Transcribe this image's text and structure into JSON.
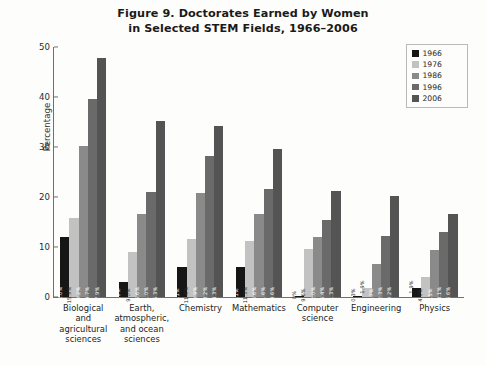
{
  "figure": {
    "title_line1": "Figure 9. Doctorates Earned by Women",
    "title_line2": "in Selected STEM Fields, 1966–2006"
  },
  "legend": {
    "position": "top-right",
    "entries": [
      {
        "label": "1966",
        "color": "#161616"
      },
      {
        "label": "1976",
        "color": "#c2c2c2"
      },
      {
        "label": "1986",
        "color": "#8a8a8a"
      },
      {
        "label": "1996",
        "color": "#6a6a6a"
      },
      {
        "label": "2006",
        "color": "#545454"
      }
    ]
  },
  "chart_data": {
    "type": "bar",
    "title": "Figure 9. Doctorates Earned by Women in Selected STEM Fields, 1966–2006",
    "xlabel": "",
    "ylabel": "Percentage",
    "ylim": [
      0,
      50
    ],
    "yticks": [
      "0",
      "10",
      "20",
      "30",
      "40",
      "50"
    ],
    "grid": false,
    "legend_position": "top-right",
    "categories": [
      "Biological and agricultural sciences",
      "Earth, atmospheric, and ocean sciences",
      "Chemistry",
      "Mathematics",
      "Computer science",
      "Engineering",
      "Physics"
    ],
    "category_lines": [
      [
        "Biological and",
        "agricultural",
        "sciences"
      ],
      [
        "Earth,",
        "atmospheric,",
        "and ocean",
        "sciences"
      ],
      [
        "Chemistry"
      ],
      [
        "Mathematics"
      ],
      [
        "Computer",
        "science"
      ],
      [
        "Engineering"
      ],
      [
        "Physics"
      ]
    ],
    "series": [
      {
        "name": "1966",
        "color": "#161616",
        "values": [
          12.0,
          3.0,
          6.1,
          6.1,
          0.0,
          0.3,
          1.9
        ],
        "labels": [
          "12.0%",
          "3.0%",
          "6.1%",
          "6.1%",
          "0%",
          "0.3%",
          "1.9%"
        ]
      },
      {
        "name": "1976",
        "color": "#c2c2c2",
        "values": [
          15.9,
          9.0,
          11.6,
          11.3,
          9.6,
          1.9,
          4.0
        ],
        "labels": [
          "15.9%",
          "9.0%",
          "11.6%",
          "11.3%",
          "9.6%",
          "1.9%",
          "4.0%"
        ]
      },
      {
        "name": "1986",
        "color": "#8a8a8a",
        "values": [
          30.2,
          16.6,
          20.9,
          16.6,
          12.0,
          6.7,
          9.5
        ],
        "labels": [
          "30.2%",
          "16.6%",
          "20.9%",
          "16.6%",
          "12.0%",
          "6.7%",
          "9.5%"
        ]
      },
      {
        "name": "1996",
        "color": "#6a6a6a",
        "values": [
          39.7,
          21.0,
          28.2,
          21.6,
          15.4,
          12.3,
          13.1
        ],
        "labels": [
          "39.7%",
          "21.0%",
          "28.2%",
          "21.6%",
          "15.4%",
          "12.3%",
          "13.1%"
        ]
      },
      {
        "name": "2006",
        "color": "#545454",
        "values": [
          47.9,
          35.3,
          34.3,
          29.6,
          21.3,
          20.2,
          16.6
        ],
        "labels": [
          "47.9%",
          "35.3%",
          "34.3%",
          "29.6%",
          "21.3%",
          "20.2%",
          "16.6%"
        ]
      }
    ]
  }
}
